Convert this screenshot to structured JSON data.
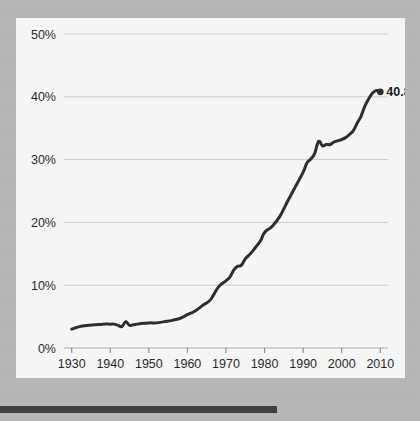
{
  "page": {
    "background_color": "#b9b9b9",
    "card_background_color": "#fdfdfd"
  },
  "bottom_bar": {
    "name": "bottom-rule",
    "color": "#3a3a3a"
  },
  "chart_data": {
    "type": "line",
    "title": "",
    "subtitle": "",
    "xlabel": "",
    "ylabel": "",
    "xlim": [
      1928,
      2012
    ],
    "ylim": [
      0,
      50
    ],
    "grid": true,
    "grid_color": "#cfcfcf",
    "legend": false,
    "legend_position": "none",
    "line_color": "#262626",
    "line_width": 3,
    "y_ticks": [
      0,
      10,
      20,
      30,
      40,
      50
    ],
    "y_tick_labels": [
      "0%",
      "10%",
      "20%",
      "30%",
      "40%",
      "50%"
    ],
    "x_ticks": [
      1930,
      1940,
      1950,
      1960,
      1970,
      1980,
      1990,
      2000,
      2010
    ],
    "x_tick_labels": [
      "1930",
      "1940",
      "1950",
      "1960",
      "1970",
      "1980",
      "1990",
      "2000",
      "2010"
    ],
    "annotations": [
      {
        "name": "endpoint-value-label",
        "text": "40.8%",
        "x": 2010,
        "y": 40.8,
        "bold": true,
        "marker": "dot"
      }
    ],
    "series": [
      {
        "name": "percent",
        "x": [
          1930,
          1932,
          1934,
          1936,
          1938,
          1940,
          1941,
          1942,
          1943,
          1944,
          1945,
          1946,
          1947,
          1948,
          1950,
          1952,
          1954,
          1956,
          1958,
          1960,
          1962,
          1964,
          1966,
          1968,
          1970,
          1971,
          1972,
          1973,
          1974,
          1975,
          1976,
          1977,
          1978,
          1979,
          1980,
          1982,
          1984,
          1986,
          1988,
          1990,
          1991,
          1992,
          1993,
          1994,
          1995,
          1996,
          1997,
          1998,
          1999,
          2000,
          2001,
          2002,
          2003,
          2004,
          2005,
          2006,
          2007,
          2008,
          2009,
          2010
        ],
        "y": [
          3.0,
          3.4,
          3.6,
          3.7,
          3.8,
          3.8,
          3.8,
          3.6,
          3.4,
          4.2,
          3.6,
          3.7,
          3.8,
          3.9,
          4.0,
          4.0,
          4.2,
          4.4,
          4.7,
          5.3,
          5.9,
          6.8,
          7.7,
          9.7,
          10.7,
          11.3,
          12.4,
          13.0,
          13.2,
          14.2,
          14.8,
          15.5,
          16.3,
          17.1,
          18.4,
          19.4,
          21.0,
          23.4,
          25.7,
          28.0,
          29.5,
          30.1,
          31.0,
          32.9,
          32.2,
          32.4,
          32.4,
          32.8,
          33.0,
          33.2,
          33.5,
          34.0,
          34.6,
          35.8,
          36.9,
          38.5,
          39.7,
          40.6,
          41.0,
          40.8
        ]
      }
    ]
  }
}
